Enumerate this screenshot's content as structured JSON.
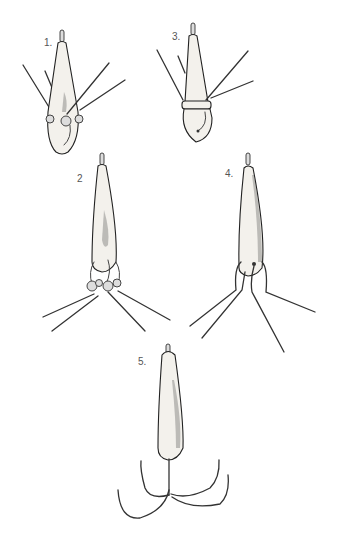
{
  "figure": {
    "items": [
      {
        "id": 1,
        "label": "1.",
        "type": "pear-shaped weight with four radiating wires and side knobs"
      },
      {
        "id": 2,
        "label": "2",
        "type": "long teardrop weight with beaded wire legs"
      },
      {
        "id": 3,
        "label": "3.",
        "type": "conical weight with bound wires and hook loop"
      },
      {
        "id": 4,
        "label": "4.",
        "type": "long teardrop weight with bent wire legs"
      },
      {
        "id": 5,
        "label": "5.",
        "type": "teardrop weight with four curved hooks (grapnel)"
      }
    ],
    "colors": {
      "background": "#ffffff",
      "ink": "#222222",
      "fill": "#f3f1ec"
    }
  }
}
